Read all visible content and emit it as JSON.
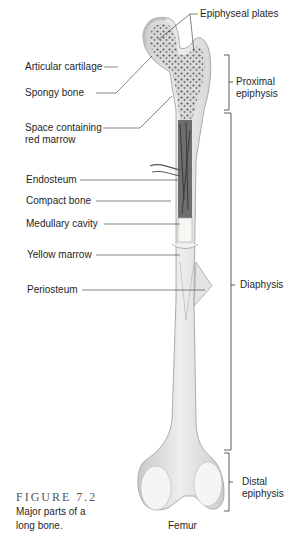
{
  "figure": {
    "number": "FIGURE 7.2",
    "caption_line1": "Major parts of a",
    "caption_line2": "long bone."
  },
  "bone_name": "Femur",
  "left_labels": {
    "articular_cartilage": "Articular cartilage",
    "spongy_bone": "Spongy bone",
    "space_red_marrow_1": "Space containing",
    "space_red_marrow_2": "red marrow",
    "endosteum": "Endosteum",
    "compact_bone": "Compact bone",
    "medullary_cavity": "Medullary cavity",
    "yellow_marrow": "Yellow marrow",
    "periosteum": "Periosteum"
  },
  "top_labels": {
    "epiphyseal_plates": "Epiphyseal plates"
  },
  "region_labels": {
    "proximal_1": "Proximal",
    "proximal_2": "epiphysis",
    "diaphysis": "Diaphysis",
    "distal_1": "Distal",
    "distal_2": "epiphysis"
  },
  "colors": {
    "bone": "#e6e6e6",
    "bone_shade": "#cfcfcf",
    "spongy": "#7a7a7a",
    "cartilage": "#f4f4f4",
    "line": "#333333"
  }
}
